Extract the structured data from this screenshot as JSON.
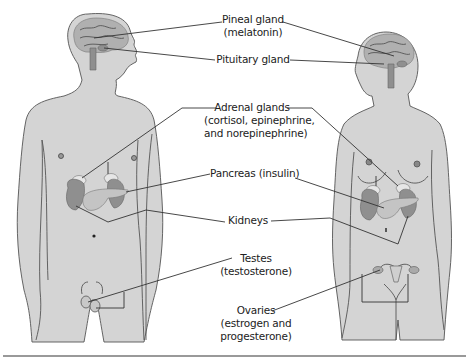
{
  "diagram": {
    "figures": [
      "male",
      "female"
    ],
    "labels": {
      "pineal": {
        "name": "Pineal gland",
        "hormone": "(melatonin)"
      },
      "pituitary": {
        "name": "Pituitary gland"
      },
      "adrenal": {
        "name": "Adrenal glands",
        "hormone_line1": "(cortisol, epinephrine,",
        "hormone_line2": "and norepinephrine)"
      },
      "pancreas": {
        "name": "Pancreas (insulin)"
      },
      "kidneys": {
        "name": "Kidneys"
      },
      "testes": {
        "name": "Testes",
        "hormone": "(testosterone)"
      },
      "ovaries": {
        "name": "Ovaries",
        "hormone_line1": "(estrogen and",
        "hormone_line2": "progesterone)"
      }
    },
    "colors": {
      "body": "#d4d4d4",
      "organ_dark": "#8f8f8f",
      "organ_mid": "#b0b0b0",
      "outline": "#555555",
      "rule": "#777777"
    }
  }
}
